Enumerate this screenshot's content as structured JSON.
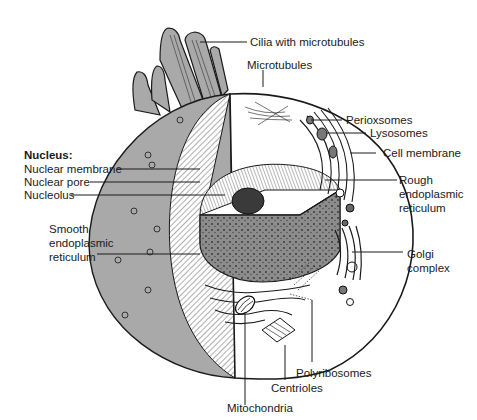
{
  "diagram": {
    "colors": {
      "cytoplasm_gray": "#a9a9a9",
      "nucleus_gray": "#8c8c8c",
      "outline": "#1a1a1a",
      "background": "#ffffff"
    },
    "labels": {
      "cilia": "Cilia with microtubules",
      "microtubules": "Microtubules",
      "perioxsomes": "Perioxsomes",
      "lysosomes": "Lysosomes",
      "cell_membrane": "Cell membrane",
      "rough_er_line1": "Rough",
      "rough_er_line2": "endoplasmic",
      "rough_er_line3": "reticulum",
      "golgi_line1": "Golgi",
      "golgi_line2": "complex",
      "nucleus_heading": "Nucleus:",
      "nuclear_membrane": "Nuclear membrane",
      "nuclear_pore": "Nuclear pore",
      "nucleolus": "Nucleolus",
      "smooth_er_line1": "Smooth",
      "smooth_er_line2": "endoplasmic",
      "smooth_er_line3": "reticulum",
      "polyribosomes": "Polyribosomes",
      "centrioles": "Centrioles",
      "mitochondria": "Mitochondria"
    }
  }
}
